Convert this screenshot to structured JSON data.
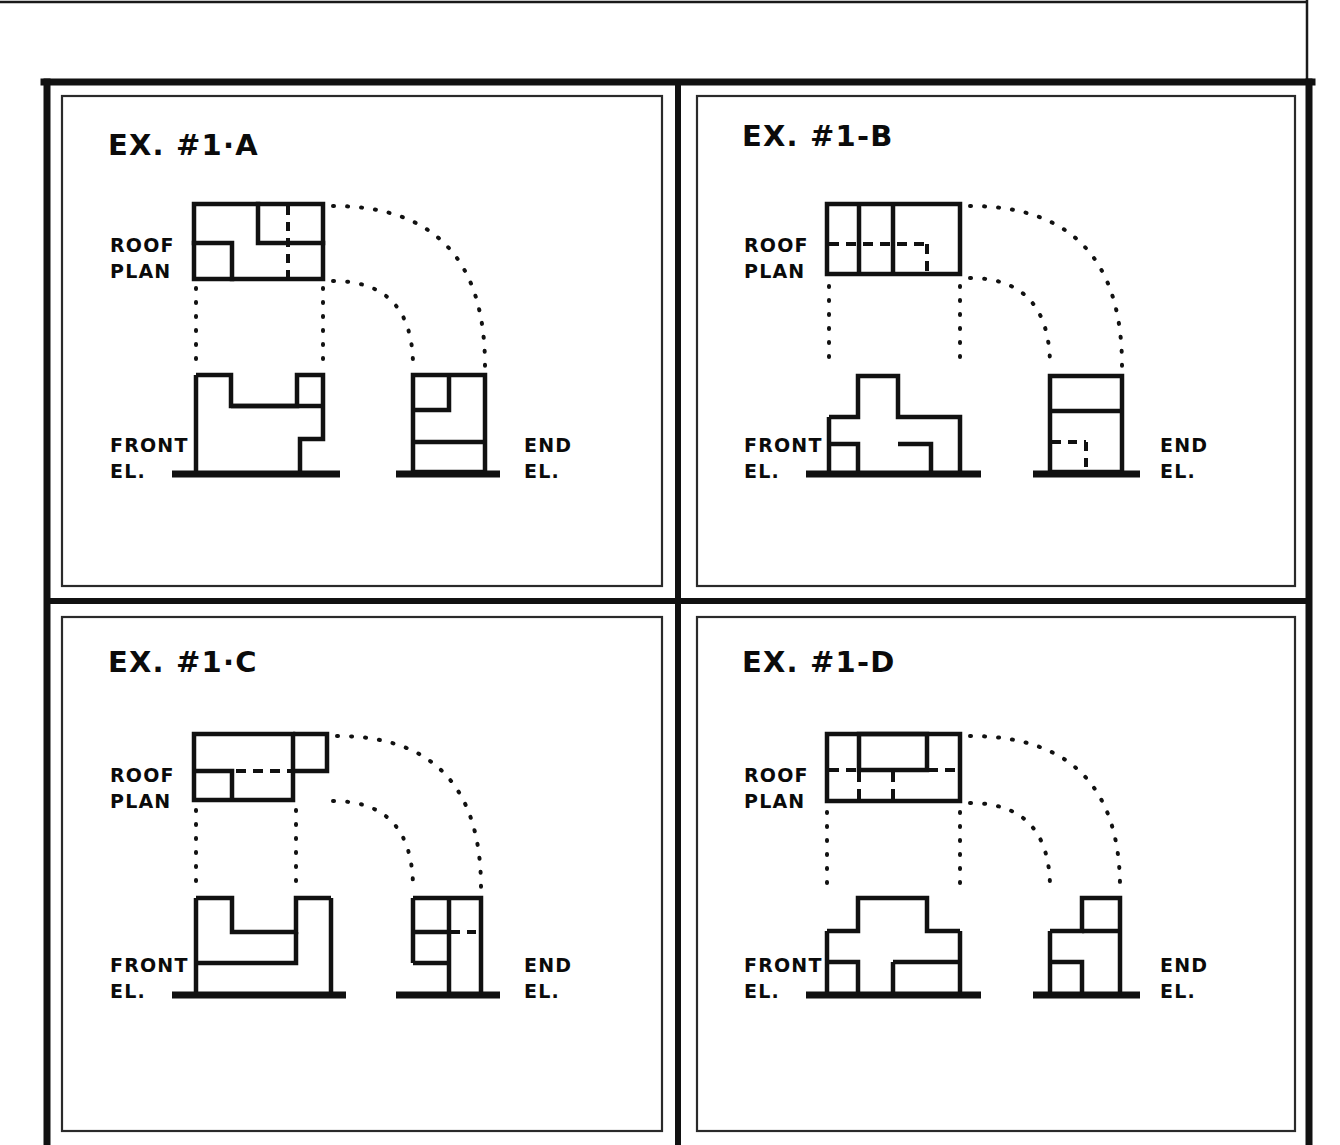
{
  "sheet": {
    "background": "#ffffff",
    "ink": "#111111",
    "outer_thin_border": true,
    "frame": {
      "x": 44,
      "y": 80,
      "width": 1268,
      "height": 1065,
      "stroke_width": 7
    },
    "divider_vertical_x": 678,
    "divider_horizontal_y": 601
  },
  "labels": {
    "roof_plan_line1": "ROOF",
    "roof_plan_line2": "PLAN",
    "front_el_line1": "FRONT",
    "front_el_line2": "EL.",
    "end_el_line1": "END",
    "end_el_line2": "EL."
  },
  "panels": [
    {
      "id": "ex-1-a",
      "title": "EX. #1·A",
      "position": "top-left",
      "roof_plan": {
        "description": "Rectangle with small square notch at lower-left and an inner room at upper-right with a vertical dashed hidden line",
        "outline": "rectangle with inner partitions",
        "hidden_lines": [
          "vertical dashed line through right portion"
        ]
      },
      "front_elevation": {
        "description": "Stepped profile: tall left block, raised upper-right block, low step at right going down to ground"
      },
      "end_elevation": {
        "description": "Rectangle divided into lower band and upper portion with small inner notch at upper left"
      }
    },
    {
      "id": "ex-1-b",
      "title": "EX. #1-B",
      "position": "top-right",
      "roof_plan": {
        "description": "Rectangle split by two vertical solid lines into three bays, with a horizontal dashed line across and a short vertical dashed leg",
        "hidden_lines": [
          "horizontal dashed line",
          "short vertical dashed line"
        ]
      },
      "front_elevation": {
        "description": "Cross / plus shaped elevation with central raised tower and two openings at the base"
      },
      "end_elevation": {
        "description": "Rectangle with a horizontal band near the top and small dashed hidden corner at the lower middle"
      }
    },
    {
      "id": "ex-1-c",
      "title": "EX. #1·C",
      "position": "bottom-left",
      "roof_plan": {
        "description": "Rectangle with a projecting block at the upper right, a small square at the lower left and a long horizontal dashed hidden line",
        "hidden_lines": [
          "horizontal dashed line across the middle"
        ]
      },
      "front_elevation": {
        "description": "U-shaped elevation with two tall legs and a recessed centre, legs continue down to ground line"
      },
      "end_elevation": {
        "description": "Tall narrow rectangle with left side sub-divided into two boxes and a short horizontal dashed line at right"
      }
    },
    {
      "id": "ex-1-d",
      "title": "EX. #1-D",
      "position": "bottom-right",
      "roof_plan": {
        "description": "Rectangle with a solid inner rectangle at the top centre, a horizontal dashed line across and two short vertical dashed lines below",
        "hidden_lines": [
          "horizontal dashed line",
          "two short vertical dashed lines"
        ]
      },
      "front_elevation": {
        "description": "Symmetrical stepped massing: wide base with two recessed openings, mid block, and a raised centre block on top"
      },
      "end_elevation": {
        "description": "Stepped profile rising to the right with a small recessed opening at the lower left"
      }
    }
  ],
  "projection_lines": {
    "style": "dotted",
    "vertical_count_per_panel": 2,
    "arc_count_per_panel": 2,
    "description": "Dotted vertical projectors drop from roof plan to front elevation; dotted quarter-circle arcs swing from roof plan to end elevation"
  }
}
